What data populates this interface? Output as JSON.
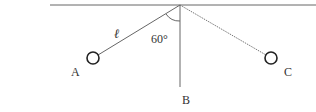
{
  "diagram": {
    "labels": {
      "A": "A",
      "B": "B",
      "C": "C",
      "length": "ℓ",
      "angle": "60°"
    },
    "colors": {
      "line": "#555555",
      "text": "#333333",
      "background": "#ffffff"
    }
  }
}
